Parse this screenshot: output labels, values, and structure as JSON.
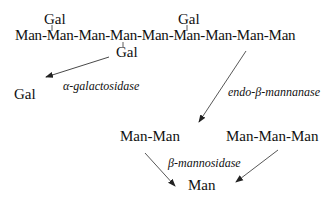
{
  "diagram": {
    "substrate": {
      "chain": "Man-Man-Man-Man-Man-Man-Man-Man-Man",
      "branches": [
        {
          "label": "Gal",
          "position": "top",
          "attached_to_residue": 2
        },
        {
          "label": "Gal",
          "position": "top",
          "attached_to_residue": 6
        },
        {
          "label": "Gal",
          "position": "bottom",
          "attached_to_residue": 4
        }
      ]
    },
    "enzymes": {
      "galactosidase": "α-galactosidase",
      "mannanase": "endo-β-mannanase",
      "mannosidase": "β-mannosidase"
    },
    "products": {
      "released_gal": "Gal",
      "dimer": "Man-Man",
      "trimer": "Man-Man-Man",
      "monomer": "Man"
    },
    "edges": [
      {
        "from": "Gal (bottom branch)",
        "to": "Gal",
        "enzyme": "α-galactosidase"
      },
      {
        "from": "mannan chain",
        "to": "Man-Man",
        "enzyme": "endo-β-mannanase"
      },
      {
        "from": "Man-Man",
        "to": "Man",
        "enzyme": "β-mannosidase"
      },
      {
        "from": "Man-Man-Man",
        "to": "Man",
        "enzyme": "β-mannosidase"
      }
    ],
    "colors": {
      "text": "#111111",
      "arrow": "#333333",
      "background": "#ffffff"
    }
  }
}
